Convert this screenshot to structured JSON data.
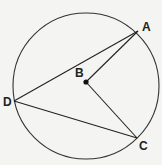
{
  "diagram": {
    "type": "circle-geometry",
    "circle": {
      "cx": 86,
      "cy": 86,
      "r": 73,
      "stroke": "#333333"
    },
    "points": [
      {
        "id": "A",
        "label": "A",
        "x": 138,
        "y": 31,
        "lx": 142,
        "ly": 31
      },
      {
        "id": "B",
        "label": "B",
        "x": 86,
        "y": 82,
        "lx": 75,
        "ly": 77
      },
      {
        "id": "C",
        "label": "C",
        "x": 137,
        "y": 138,
        "lx": 139,
        "ly": 150
      },
      {
        "id": "D",
        "label": "D",
        "x": 14,
        "y": 101,
        "lx": 3,
        "ly": 106
      }
    ],
    "segments": [
      [
        "D",
        "A"
      ],
      [
        "D",
        "C"
      ],
      [
        "B",
        "A"
      ],
      [
        "B",
        "C"
      ]
    ],
    "center_point": "B"
  }
}
